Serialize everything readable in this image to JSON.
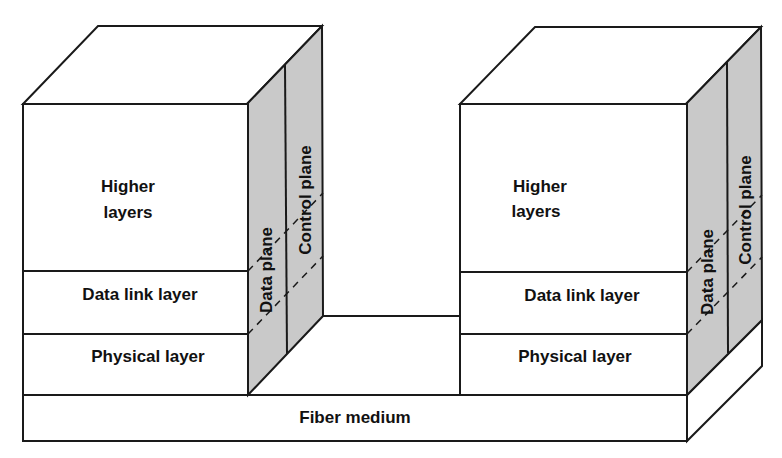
{
  "colors": {
    "line": "#1a1a1a",
    "shade": "#c9c9c9",
    "face": "#ffffff"
  },
  "base": {
    "label": "Fiber medium"
  },
  "nodes": [
    {
      "id": "left",
      "layers": {
        "higher_line1": "Higher",
        "higher_line2": "layers",
        "data_link": "Data link layer",
        "physical": "Physical layer"
      },
      "planes": {
        "data": "Data plane",
        "control": "Control plane"
      }
    },
    {
      "id": "right",
      "layers": {
        "higher_line1": "Higher",
        "higher_line2": "layers",
        "data_link": "Data link layer",
        "physical": "Physical layer"
      },
      "planes": {
        "data": "Data plane",
        "control": "Control plane"
      }
    }
  ]
}
